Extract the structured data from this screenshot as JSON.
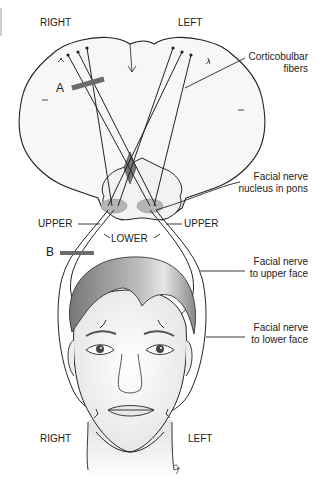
{
  "diagram": {
    "labels": {
      "top_right_side": "RIGHT",
      "top_left_side": "LEFT",
      "bottom_right_side": "RIGHT",
      "bottom_left_side": "LEFT",
      "corticobulbar_line1": "Corticobulbar",
      "corticobulbar_line2": "fibers",
      "nucleus_line1": "Facial nerve",
      "nucleus_line2": "nucleus in pons",
      "upper_left": "UPPER",
      "upper_right": "UPPER",
      "lower": "LOWER",
      "lesion_a": "A",
      "lesion_b": "B",
      "upper_face_line1": "Facial nerve",
      "upper_face_line2": "to upper face",
      "lower_face_line1": "Facial nerve",
      "lower_face_line2": "to lower face"
    },
    "colors": {
      "lesion_bar": "#6b6b6b",
      "decussation": "#777777",
      "nucleus_fill": "#b5b5b5",
      "line": "#222222",
      "hair": "#8a8a8a"
    }
  }
}
